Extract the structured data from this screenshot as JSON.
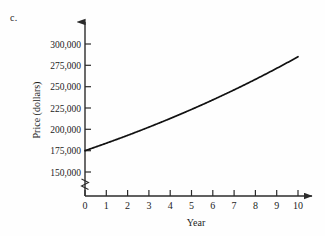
{
  "figure": {
    "part_label": "c."
  },
  "chart_data": {
    "type": "line",
    "title": "",
    "xlabel": "Year",
    "ylabel": "Price (dollars)",
    "x": [
      0,
      1,
      2,
      3,
      4,
      5,
      6,
      7,
      8,
      9,
      10
    ],
    "values": [
      175000,
      183750,
      192938,
      202584,
      212714,
      223349,
      234517,
      246243,
      258555,
      271483,
      285057
    ],
    "series": [
      {
        "name": "Price",
        "values": [
          175000,
          183750,
          192938,
          202584,
          212714,
          223349,
          234517,
          246243,
          258555,
          271483,
          285057
        ]
      }
    ],
    "xlim": [
      0,
      10
    ],
    "ylim": [
      150000,
      300000
    ],
    "xticks": [
      0,
      1,
      2,
      3,
      4,
      5,
      6,
      7,
      8,
      9,
      10
    ],
    "xtick_labels": [
      "0",
      "1",
      "2",
      "3",
      "4",
      "5",
      "6",
      "7",
      "8",
      "9",
      "10"
    ],
    "yticks": [
      150000,
      175000,
      200000,
      225000,
      250000,
      275000,
      300000
    ],
    "ytick_labels": [
      "150,000",
      "175,000",
      "200,000",
      "225,000",
      "250,000",
      "275,000",
      "300,000"
    ],
    "grid": false,
    "legend": "none",
    "axis_break": true,
    "axis_break_axis": "y",
    "line_color": "#111111",
    "background_color": "#fefefe",
    "axis_color": "#2b2b2b",
    "start_value": 175000,
    "end_value": 285057,
    "growth_rate_percent": 5
  }
}
